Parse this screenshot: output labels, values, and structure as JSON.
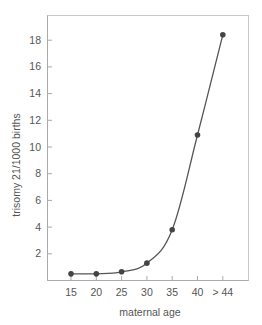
{
  "chart_data": {
    "type": "line",
    "title": "",
    "xlabel": "maternal age",
    "ylabel": "trisomy 21/1000 births",
    "categories": [
      "15",
      "20",
      "25",
      "30",
      "35",
      "40",
      "> 44"
    ],
    "series": [
      {
        "name": "trisomy 21/1000 births",
        "values": [
          0.5,
          0.5,
          0.65,
          1.3,
          3.8,
          10.9,
          18.4
        ]
      }
    ],
    "yticks": [
      2,
      4,
      6,
      8,
      10,
      12,
      14,
      16,
      18
    ],
    "ylim": [
      0,
      19.8
    ],
    "grid": false,
    "legend": "none",
    "colors": {
      "line": "#555555",
      "marker": "#444444",
      "axis": "#aaaaaa",
      "text": "#555555"
    }
  }
}
